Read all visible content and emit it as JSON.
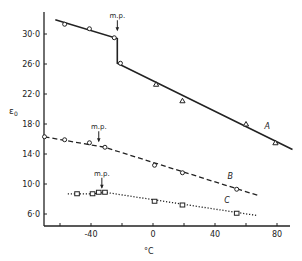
{
  "chart_data": {
    "type": "line",
    "title": "",
    "xlabel": "°C",
    "ylabel": "ε₀",
    "xlim": [
      -72,
      92
    ],
    "ylim": [
      4.3,
      32.5
    ],
    "x_ticks": [
      -60,
      -40,
      -20,
      0,
      20,
      40,
      60,
      80
    ],
    "x_tick_labels": [
      "-40",
      "0",
      "40",
      "80"
    ],
    "x_tick_label_values": [
      -40,
      0,
      40,
      80
    ],
    "y_ticks": [
      6,
      10,
      14,
      18,
      22,
      26,
      30
    ],
    "y_tick_labels": [
      "6·0",
      "10·0",
      "14·0",
      "18·0",
      "22·0",
      "26·0",
      "30·0"
    ],
    "grid": false,
    "legend": "inline labels",
    "series": [
      {
        "name": "A",
        "line_style": "solid",
        "label_pos": [
          72,
          17.3
        ],
        "line": [
          [
            -63,
            31.9
          ],
          [
            -23,
            29.4
          ],
          [
            -23,
            26.1
          ],
          [
            90,
            14.6
          ]
        ],
        "markers": [
          {
            "shape": "circle",
            "x": -57,
            "y": 31.3
          },
          {
            "shape": "circle",
            "x": -41,
            "y": 30.7
          },
          {
            "shape": "circle",
            "x": -25,
            "y": 29.5
          },
          {
            "shape": "circle",
            "x": -21,
            "y": 26.1
          },
          {
            "shape": "triangle",
            "x": 2,
            "y": 23.3
          },
          {
            "shape": "triangle",
            "x": 19,
            "y": 21.1
          },
          {
            "shape": "triangle",
            "x": 60,
            "y": 18.0
          },
          {
            "shape": "triangle",
            "x": 79,
            "y": 15.5
          }
        ],
        "melting_point": {
          "x": -23,
          "label": "m.p.",
          "label_y": 32.1
        }
      },
      {
        "name": "B",
        "line_style": "dashed",
        "label_pos": [
          48,
          10.7
        ],
        "line": [
          [
            -70,
            16.3
          ],
          [
            -31,
            14.9
          ],
          [
            69,
            8.4
          ]
        ],
        "markers": [
          {
            "shape": "circle",
            "x": -70,
            "y": 16.3
          },
          {
            "shape": "circle",
            "x": -57,
            "y": 15.9
          },
          {
            "shape": "circle",
            "x": -41,
            "y": 15.5
          },
          {
            "shape": "circle",
            "x": -31,
            "y": 14.9
          },
          {
            "shape": "circle",
            "x": 1,
            "y": 12.5
          },
          {
            "shape": "circle",
            "x": 19,
            "y": 11.5
          },
          {
            "shape": "circle",
            "x": 54,
            "y": 9.3
          }
        ],
        "melting_point": {
          "x": -35,
          "label": "m.p.",
          "label_y": 17.3
        }
      },
      {
        "name": "C",
        "line_style": "dotted",
        "label_pos": [
          46,
          7.5
        ],
        "line": [
          [
            -55,
            8.7
          ],
          [
            -39,
            8.7
          ],
          [
            -31,
            8.9
          ],
          [
            67,
            5.8
          ]
        ],
        "markers": [
          {
            "shape": "square",
            "x": -49,
            "y": 8.7
          },
          {
            "shape": "square",
            "x": -39,
            "y": 8.7
          },
          {
            "shape": "square",
            "x": -35,
            "y": 8.9
          },
          {
            "shape": "square",
            "x": -31,
            "y": 8.9
          },
          {
            "shape": "square",
            "x": 1,
            "y": 7.7
          },
          {
            "shape": "square",
            "x": 19,
            "y": 7.2
          },
          {
            "shape": "square",
            "x": 54,
            "y": 6.1
          }
        ],
        "melting_point": {
          "x": -33,
          "label": "m.p.",
          "label_y": 11.1
        }
      }
    ]
  },
  "plot": {
    "x_axis_title": "°C",
    "y_axis_title": "ε",
    "y_axis_title_sub": "0"
  }
}
